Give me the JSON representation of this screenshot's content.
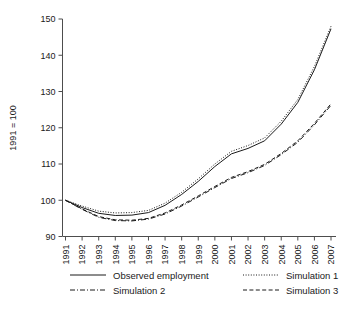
{
  "chart_data": {
    "type": "line",
    "title": "",
    "subtitle": "",
    "xlabel": "",
    "ylabel": "1991 = 100",
    "xlim": [
      1991,
      2007
    ],
    "ylim": [
      90,
      150
    ],
    "yticks": [
      90,
      100,
      110,
      120,
      130,
      140,
      150
    ],
    "ytick_labels": [
      "90",
      "100",
      "110",
      "120",
      "130",
      "140",
      "150"
    ],
    "grid": false,
    "legend_position": "below",
    "x": [
      1991,
      1992,
      1993,
      1994,
      1995,
      1996,
      1997,
      1998,
      1999,
      2000,
      2001,
      2002,
      2003,
      2004,
      2005,
      2006,
      2007
    ],
    "xtick_labels": [
      "1991",
      "1992",
      "1993",
      "1994",
      "1995",
      "1996",
      "1997",
      "1998",
      "1999",
      "2000",
      "2001",
      "2002",
      "2003",
      "2004",
      "2005",
      "2006",
      "2007"
    ],
    "series": [
      {
        "name": "Observed employment",
        "style": "solid",
        "color": "#1a1a1a",
        "values": [
          100.0,
          98.0,
          96.4,
          95.8,
          95.9,
          96.6,
          98.6,
          101.6,
          105.2,
          109.3,
          112.8,
          114.3,
          116.4,
          121.0,
          127.0,
          136.0,
          147.3
        ]
      },
      {
        "name": "Simulation 1",
        "style": "dotted",
        "color": "#1a1a1a",
        "values": [
          100.0,
          98.4,
          97.0,
          96.5,
          96.6,
          97.2,
          99.2,
          102.2,
          105.9,
          110.0,
          113.5,
          115.1,
          117.2,
          121.8,
          127.8,
          136.9,
          148.0
        ]
      },
      {
        "name": "Simulation 2",
        "style": "dashdot",
        "color": "#1a1a1a",
        "values": [
          100.0,
          97.5,
          95.3,
          94.4,
          94.3,
          94.8,
          96.2,
          98.4,
          100.9,
          103.5,
          106.0,
          107.6,
          109.6,
          112.6,
          116.0,
          120.8,
          126.2
        ]
      },
      {
        "name": "Simulation 3",
        "style": "dashed",
        "color": "#1a1a1a",
        "values": [
          100.0,
          97.6,
          95.5,
          94.6,
          94.5,
          95.0,
          96.5,
          98.7,
          101.2,
          103.8,
          106.3,
          107.9,
          109.9,
          112.9,
          116.4,
          121.2,
          126.6
        ]
      }
    ]
  },
  "axis": {
    "y_axis_title": "1991 = 100"
  },
  "legend": {
    "entries": [
      {
        "label": "Observed employment",
        "style": "solid"
      },
      {
        "label": "Simulation 1",
        "style": "dotted"
      },
      {
        "label": "Simulation 2",
        "style": "dashdot"
      },
      {
        "label": "Simulation 3",
        "style": "dashed"
      }
    ]
  }
}
